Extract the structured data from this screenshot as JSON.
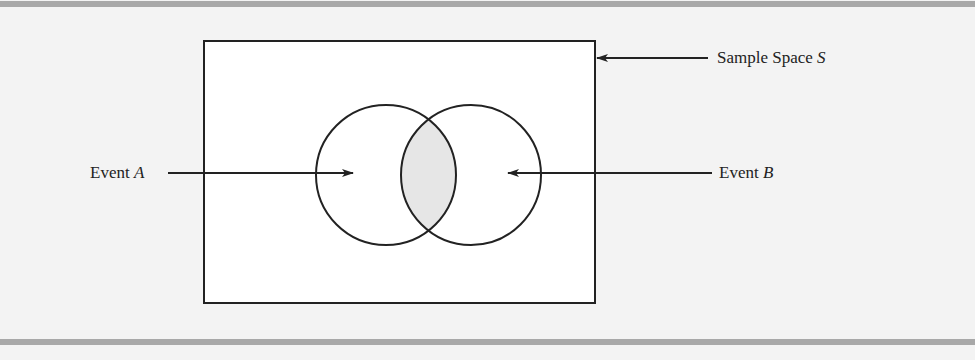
{
  "diagram": {
    "type": "venn",
    "title": "",
    "sample_space": {
      "label": "Sample Space",
      "symbol": "S"
    },
    "events": [
      {
        "label": "Event",
        "symbol": "A"
      },
      {
        "label": "Event",
        "symbol": "B"
      }
    ],
    "shaded_region": "intersection",
    "colors": {
      "background": "#f3f3f3",
      "rule": "#a8a8a8",
      "stroke": "#222222",
      "box_fill": "#ffffff",
      "intersection_fill": "#e6e6e6"
    }
  }
}
